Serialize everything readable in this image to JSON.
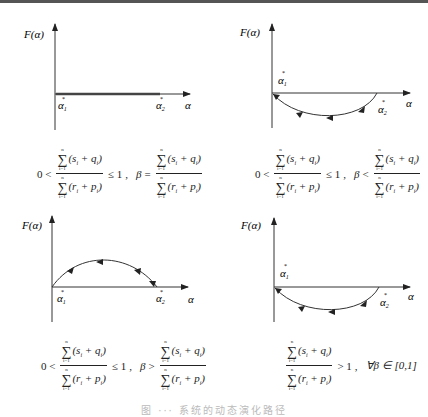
{
  "figure": {
    "caption": "图 ··· 系统的动态演化路径",
    "panels": [
      {
        "id": "panel-1",
        "y_label": "F(α)",
        "x_label": "α",
        "alpha1_label": "α",
        "alpha1_sub": "1",
        "alpha2_label": "α",
        "alpha2_sub": "2",
        "star": "*",
        "curve": "flat line along α-axis from α1* to α2*",
        "condition": {
          "prefix": "0 <",
          "relation1": "≤ 1",
          "sep": ",",
          "beta_lhs": "β",
          "beta_rel": "=",
          "suffix": ""
        }
      },
      {
        "id": "panel-2",
        "y_label": "F(α)",
        "x_label": "α",
        "alpha1_label": "α",
        "alpha1_sub": "1",
        "alpha2_label": "α",
        "alpha2_sub": "2",
        "star": "*",
        "curve": "below-axis arc from α2* back to α1* (arrows pointing left)",
        "condition": {
          "prefix": "0 <",
          "relation1": "≤ 1",
          "sep": ",",
          "beta_lhs": "β",
          "beta_rel": "<",
          "suffix": ""
        }
      },
      {
        "id": "panel-3",
        "y_label": "F(α)",
        "x_label": "α",
        "alpha1_label": "α",
        "alpha1_sub": "1",
        "alpha2_label": "α",
        "alpha2_sub": "2",
        "star": "*",
        "curve": "above-axis arc from α1* to α2* (arrows pointing right)",
        "condition": {
          "prefix": "0 <",
          "relation1": "≤ 1",
          "sep": ",",
          "beta_lhs": "β",
          "beta_rel": ">",
          "suffix": ""
        }
      },
      {
        "id": "panel-4",
        "y_label": "F(α)",
        "x_label": "α",
        "alpha1_label": "α",
        "alpha1_sub": "1",
        "alpha2_label": "α",
        "alpha2_sub": "2",
        "star": "*",
        "curve": "below-axis arc from α2* back to α1* (arrows pointing left)",
        "condition": {
          "prefix": "",
          "relation1": "> 1",
          "sep": ",",
          "beta_lhs": "",
          "beta_rel": "",
          "suffix": "∀β ∈ [0,1]"
        }
      }
    ],
    "fraction": {
      "sum_upper": "n",
      "sum_lower": "i=1",
      "sigma": "∑",
      "numerator": "(s_i + q_i)",
      "numerator_text": "(s",
      "numerator_mid": " + q",
      "numerator_end": ")",
      "denominator_text": "(r",
      "denominator_mid": " + p",
      "denominator_end": ")",
      "sub_i": "i"
    }
  }
}
